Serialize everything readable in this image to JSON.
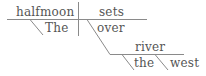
{
  "diagram": {
    "type": "sentence-diagram",
    "sentence": "The halfmoon sets over the river west",
    "words": {
      "subject": "halfmoon",
      "subject_modifier": "The",
      "verb": "sets",
      "preposition": "over",
      "object": "river",
      "object_modifier_1": "the",
      "object_modifier_2": "west"
    },
    "colors": {
      "text": "#555555",
      "lines": "#8a8a8a",
      "background": "#ffffff"
    }
  }
}
